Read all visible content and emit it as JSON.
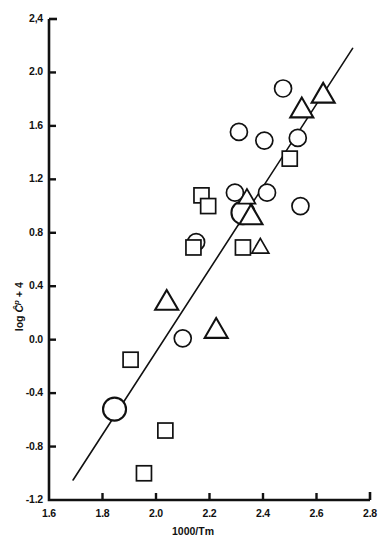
{
  "chart_data": {
    "type": "scatter",
    "title": "",
    "xlabel": "1000/Tm",
    "ylabel": "log Ĉp + 4",
    "xlim": [
      1.6,
      2.8
    ],
    "ylim": [
      -1.2,
      2.4
    ],
    "xticks": [
      "1.6",
      "1.8",
      "2.0",
      "2.2",
      "2.4",
      "2.6",
      "2.8"
    ],
    "xtick_values": [
      1.6,
      1.8,
      2.0,
      2.2,
      2.4,
      2.6,
      2.8
    ],
    "yticks": [
      "2,4",
      "2.0",
      "1.6",
      "1.2",
      "0.8",
      "0.4",
      "0.0",
      "-0.4",
      "-0.8",
      "-1.2"
    ],
    "ytick_values": [
      2.4,
      2.0,
      1.6,
      1.2,
      0.8,
      0.4,
      0.0,
      -0.4,
      -0.8,
      -1.2
    ],
    "grid": false,
    "legend": "none",
    "series": [
      {
        "name": "circles",
        "marker": "circle",
        "filled": false,
        "points": [
          {
            "x": 1.845,
            "y": -0.52,
            "size": "large"
          },
          {
            "x": 2.1,
            "y": 0.01,
            "size": "medium"
          },
          {
            "x": 2.15,
            "y": 0.73,
            "size": "medium"
          },
          {
            "x": 2.295,
            "y": 1.1,
            "size": "medium"
          },
          {
            "x": 2.325,
            "y": 0.95,
            "size": "large"
          },
          {
            "x": 2.31,
            "y": 1.555,
            "size": "medium"
          },
          {
            "x": 2.405,
            "y": 1.49,
            "size": "medium"
          },
          {
            "x": 2.415,
            "y": 1.1,
            "size": "medium"
          },
          {
            "x": 2.475,
            "y": 1.88,
            "size": "medium"
          },
          {
            "x": 2.53,
            "y": 1.51,
            "size": "medium"
          },
          {
            "x": 2.54,
            "y": 1.0,
            "size": "medium"
          }
        ]
      },
      {
        "name": "squares",
        "marker": "square",
        "filled": false,
        "points": [
          {
            "x": 1.905,
            "y": -0.15,
            "size": "medium"
          },
          {
            "x": 1.955,
            "y": -1.0,
            "size": "medium"
          },
          {
            "x": 2.035,
            "y": -0.68,
            "size": "medium"
          },
          {
            "x": 2.14,
            "y": 0.69,
            "size": "medium"
          },
          {
            "x": 2.17,
            "y": 1.08,
            "size": "medium"
          },
          {
            "x": 2.195,
            "y": 1.0,
            "size": "medium"
          },
          {
            "x": 2.325,
            "y": 0.69,
            "size": "medium"
          },
          {
            "x": 2.5,
            "y": 1.355,
            "size": "medium"
          }
        ]
      },
      {
        "name": "triangles",
        "marker": "triangle",
        "filled": false,
        "points": [
          {
            "x": 2.04,
            "y": 0.28,
            "size": "large"
          },
          {
            "x": 2.225,
            "y": 0.07,
            "size": "large"
          },
          {
            "x": 2.34,
            "y": 1.06,
            "size": "medium"
          },
          {
            "x": 2.355,
            "y": 0.92,
            "size": "large"
          },
          {
            "x": 2.39,
            "y": 0.69,
            "size": "medium"
          },
          {
            "x": 2.545,
            "y": 1.72,
            "size": "large"
          },
          {
            "x": 2.625,
            "y": 1.83,
            "size": "large"
          }
        ]
      }
    ],
    "fit_line": {
      "name": "regression-line",
      "x_start": 1.69,
      "y_start": -1.05,
      "x_end": 2.735,
      "y_end": 2.18
    }
  }
}
